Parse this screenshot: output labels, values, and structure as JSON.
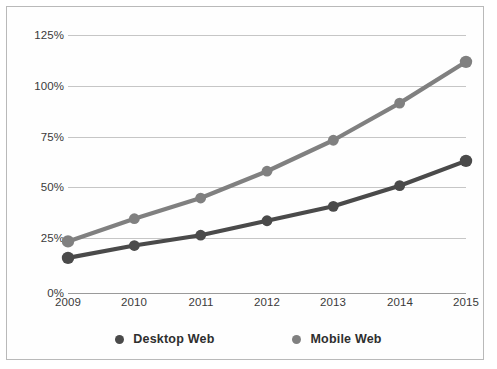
{
  "chart_data": {
    "type": "line",
    "title": "",
    "xlabel": "",
    "ylabel": "",
    "x": [
      "2009",
      "2010",
      "2011",
      "2012",
      "2013",
      "2014",
      "2015"
    ],
    "categories": [
      "2009",
      "2010",
      "2011",
      "2012",
      "2013",
      "2014",
      "2015"
    ],
    "series": [
      {
        "name": "Desktop Web",
        "color": "#4a4a4a",
        "values": [
          17,
          23,
          28,
          35,
          42,
          52,
          64
        ]
      },
      {
        "name": "Mobile Web",
        "color": "#808080",
        "values": [
          25,
          36,
          46,
          59,
          74,
          92,
          112
        ]
      }
    ],
    "ylim": [
      0,
      125
    ],
    "yticks": [
      0,
      25,
      50,
      75,
      100,
      125
    ],
    "ytick_labels": [
      "0%",
      "25%",
      "50%",
      "75%",
      "100%",
      "125%"
    ],
    "xtick_labels": [
      "2009",
      "2010",
      "2011",
      "2012",
      "2013",
      "2014",
      "2015"
    ],
    "grid": true,
    "grid_color": "#c6c6c6",
    "legend_position": "bottom",
    "marker": "circle",
    "background": "#ffffff",
    "border_color": "#b9b9b9"
  },
  "legend": {
    "entries": [
      {
        "label": "Desktop Web",
        "color": "#4a4a4a"
      },
      {
        "label": "Mobile Web",
        "color": "#808080"
      }
    ]
  }
}
